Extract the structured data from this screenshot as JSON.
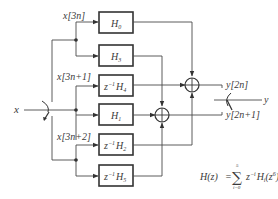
{
  "diagram": {
    "type": "polyphase-filter-block-diagram",
    "input_label": "x",
    "output_label": "y",
    "input_branches": [
      {
        "label": "x[3n]"
      },
      {
        "label": "x[3n+1]"
      },
      {
        "label": "x[3n+2]"
      }
    ],
    "blocks": [
      {
        "id": "b0",
        "prefix": "",
        "name": "H",
        "sub": "0"
      },
      {
        "id": "b1",
        "prefix": "",
        "name": "H",
        "sub": "3"
      },
      {
        "id": "b2",
        "prefix": "z",
        "prefix_sup": "−1",
        "name": "H",
        "sub": "4"
      },
      {
        "id": "b3",
        "prefix": "",
        "name": "H",
        "sub": "1"
      },
      {
        "id": "b4",
        "prefix": "z",
        "prefix_sup": "−1",
        "name": "H",
        "sub": "2"
      },
      {
        "id": "b5",
        "prefix": "z",
        "prefix_sup": "−1",
        "name": "H",
        "sub": "5"
      }
    ],
    "adders": [
      {
        "id": "adder-1",
        "output_label": "y[2n]",
        "inputs": [
          "H0",
          "z^-1 H4",
          "z^-1 H2"
        ]
      },
      {
        "id": "adder-2",
        "output_label": "y[2n+1]",
        "inputs": [
          "H3",
          "H1",
          "z^-1 H5"
        ]
      }
    ],
    "formula": {
      "lhs": "H(z)",
      "equals": "=",
      "sum_upper": "5",
      "sum_lower": "i=0",
      "term_z": "z",
      "term_z_sup": "−i",
      "term_h": "H",
      "term_h_sub": "i",
      "term_arg": "(z",
      "term_arg_sup": "6",
      "term_close": ")"
    }
  }
}
